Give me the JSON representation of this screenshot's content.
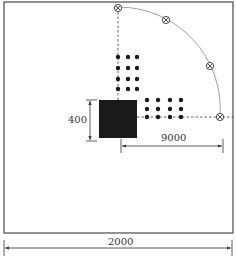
{
  "diagram": {
    "colors": {
      "line": "#555555",
      "solid": "#1a1a1a",
      "arc": "#777777",
      "background": "#ffffff"
    },
    "outer_boundary": {
      "x": 4,
      "y": 2,
      "w": 229,
      "h": 231
    },
    "center_block": {
      "x": 99,
      "y": 100,
      "w": 38,
      "h": 38
    },
    "arc": {
      "cx": 118,
      "cy": 117,
      "r": 102
    },
    "markers": [
      {
        "x": 118,
        "y": 8
      },
      {
        "x": 166,
        "y": 20
      },
      {
        "x": 210,
        "y": 66
      },
      {
        "x": 220,
        "y": 117
      }
    ],
    "dot_grid_vertical": {
      "cols_x": [
        118,
        128,
        137
      ],
      "rows_y": [
        56,
        69,
        79,
        89
      ]
    },
    "dot_grid_horizontal": {
      "cols_x": [
        147,
        158,
        170,
        181
      ],
      "rows_y": [
        100,
        109,
        117
      ]
    },
    "dimensions": {
      "height_label": "400",
      "radius_label": "9000",
      "width_label": "2000"
    }
  }
}
